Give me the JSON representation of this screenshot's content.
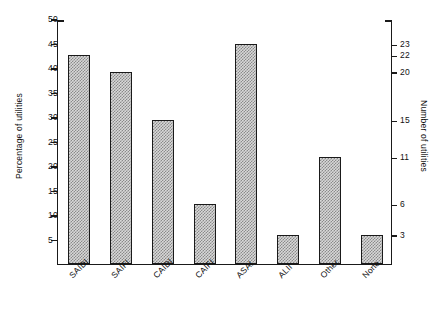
{
  "chart_data": {
    "type": "bar",
    "title": "",
    "categories": [
      "SAIDI",
      "SAIFI",
      "CAIDI",
      "CAIFI",
      "ASAI",
      "ALII",
      "Other",
      "None"
    ],
    "values": [
      42.6,
      39.2,
      29.3,
      12.2,
      44.8,
      5.9,
      21.8,
      5.9
    ],
    "counts": [
      22,
      20,
      15,
      6,
      23,
      3,
      11,
      3
    ],
    "xlabel": "",
    "ylabel": "Percentage of utilities",
    "ylabel_right": "Number of utilities",
    "ylim": [
      0,
      50
    ],
    "yticks_left": [
      5,
      10,
      15,
      20,
      25,
      30,
      35,
      40,
      45,
      50
    ],
    "yticks_right": [
      3,
      6,
      11,
      15,
      20,
      22,
      23
    ],
    "yticks_right_percent": [
      5.9,
      12.2,
      21.8,
      29.3,
      39.2,
      42.6,
      44.8
    ],
    "grid": false,
    "legend": false,
    "bar_fill_color": "#d8d8d8",
    "bar_edge_color": "#1a1a1a",
    "axis_color": "#1a1a1a"
  }
}
